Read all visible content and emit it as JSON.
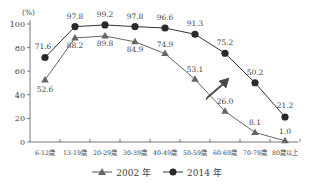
{
  "chart_data": {
    "type": "line",
    "title": "",
    "ylabel": "(%)",
    "xlabel": "",
    "ylim": [
      0,
      100
    ],
    "yticks": [
      0,
      20,
      40,
      60,
      80,
      100
    ],
    "grid": false,
    "legend_position": "bottom",
    "categories": [
      "6-12歳",
      "13-19歳",
      "20-29歳",
      "30-39歳",
      "40-49歳",
      "50-59歳",
      "60-69歳",
      "70-79歳",
      "80歳以上"
    ],
    "series": [
      {
        "name": "2002 年",
        "marker": "triangle",
        "color": "#666666",
        "values": [
          52.6,
          88.2,
          89.8,
          84.9,
          74.9,
          53.1,
          26.0,
          8.1,
          1.0
        ],
        "labels": [
          "52.6",
          "88.2",
          "89.8",
          "84.9",
          "74.9",
          "53.1",
          "26.0",
          "8.1",
          "1.0"
        ]
      },
      {
        "name": "2014 年",
        "marker": "circle",
        "color": "#333333",
        "values": [
          71.6,
          97.8,
          99.2,
          97.8,
          96.6,
          91.3,
          75.2,
          50.2,
          21.2
        ],
        "labels": [
          "71.6",
          "97.8",
          "99.2",
          "97.8",
          "96.6",
          "91.3",
          "75.2",
          "50.2",
          "21.2"
        ]
      }
    ],
    "annotations": [
      {
        "type": "arrow",
        "direction": "up-right",
        "color": "#444444",
        "between_series": true,
        "near_category": "60-69歳"
      }
    ]
  },
  "legend": {
    "items": [
      {
        "label": "2002 年",
        "marker": "triangle"
      },
      {
        "label": "2014 年",
        "marker": "circle"
      }
    ]
  }
}
